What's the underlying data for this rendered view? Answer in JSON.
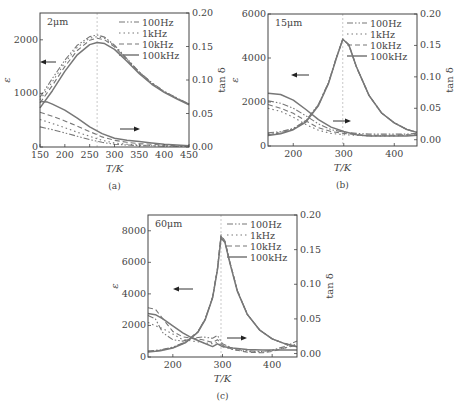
{
  "chart_data": [
    {
      "id": "a",
      "type": "line",
      "caption": "(a)",
      "annotation": "2μm",
      "xlabel": "T/K",
      "ylabel_left": "ε",
      "ylabel_right": "tan δ",
      "xlim": [
        150,
        450
      ],
      "ylim_left": [
        0,
        2500
      ],
      "ylim_right": [
        0,
        0.2
      ],
      "xticks": [
        150,
        200,
        250,
        300,
        350,
        400,
        450
      ],
      "yticks_left": [
        0,
        1000,
        2000
      ],
      "yticks_right": [
        0.0,
        0.05,
        0.1,
        0.15,
        0.2
      ],
      "peak_marker_x": 265,
      "legend": [
        "100Hz",
        "1kHz",
        "10kHz",
        "100kHz"
      ],
      "grid": false,
      "box": {
        "x": 40,
        "y": 13,
        "w": 149,
        "h": 134
      },
      "arrows": [
        {
          "dir": "left",
          "x": 56,
          "y": 62,
          "len": 16
        },
        {
          "dir": "right",
          "x": 120,
          "y": 129,
          "len": 20
        }
      ],
      "series_eps": [
        {
          "name": "100Hz",
          "x": [
            150,
            175,
            200,
            225,
            250,
            265,
            280,
            300,
            325,
            350,
            375,
            400,
            425,
            450
          ],
          "y": [
            930,
            1280,
            1620,
            1900,
            2060,
            2090,
            2050,
            1900,
            1650,
            1400,
            1200,
            1040,
            920,
            800
          ]
        },
        {
          "name": "1kHz",
          "x": [
            150,
            175,
            200,
            225,
            250,
            265,
            280,
            300,
            325,
            350,
            375,
            400,
            425,
            450
          ],
          "y": [
            880,
            1220,
            1570,
            1860,
            2030,
            2060,
            2030,
            1890,
            1640,
            1400,
            1190,
            1030,
            910,
            800
          ]
        },
        {
          "name": "10kHz",
          "x": [
            150,
            175,
            200,
            225,
            250,
            265,
            280,
            300,
            325,
            350,
            375,
            400,
            425,
            450
          ],
          "y": [
            820,
            1150,
            1500,
            1800,
            1990,
            2030,
            2000,
            1870,
            1630,
            1390,
            1190,
            1030,
            910,
            800
          ]
        },
        {
          "name": "100kHz",
          "x": [
            150,
            175,
            200,
            225,
            250,
            265,
            280,
            300,
            325,
            350,
            375,
            400,
            425,
            450
          ],
          "y": [
            730,
            1050,
            1410,
            1720,
            1910,
            1950,
            1930,
            1820,
            1600,
            1370,
            1170,
            1020,
            900,
            790
          ]
        }
      ],
      "series_tan": [
        {
          "name": "100Hz",
          "x": [
            150,
            175,
            200,
            225,
            250,
            275,
            300,
            325,
            350,
            375,
            400,
            425,
            450
          ],
          "y": [
            0.03,
            0.026,
            0.021,
            0.016,
            0.011,
            0.007,
            0.004,
            0.003,
            0.002,
            0.002,
            0.001,
            0.001,
            0.001
          ]
        },
        {
          "name": "1kHz",
          "x": [
            150,
            175,
            200,
            225,
            250,
            275,
            300,
            325,
            350,
            375,
            400,
            425,
            450
          ],
          "y": [
            0.041,
            0.035,
            0.029,
            0.022,
            0.016,
            0.01,
            0.006,
            0.004,
            0.003,
            0.002,
            0.002,
            0.001,
            0.001
          ]
        },
        {
          "name": "10kHz",
          "x": [
            150,
            175,
            200,
            225,
            250,
            275,
            300,
            325,
            350,
            375,
            400,
            425,
            450
          ],
          "y": [
            0.052,
            0.046,
            0.039,
            0.031,
            0.023,
            0.015,
            0.01,
            0.007,
            0.005,
            0.004,
            0.003,
            0.002,
            0.002
          ]
        },
        {
          "name": "100kHz",
          "x": [
            150,
            165,
            175,
            200,
            225,
            250,
            275,
            300,
            325,
            350,
            375,
            400,
            425,
            450
          ],
          "y": [
            0.068,
            0.067,
            0.064,
            0.055,
            0.043,
            0.03,
            0.02,
            0.013,
            0.01,
            0.008,
            0.006,
            0.004,
            0.003,
            0.002
          ]
        }
      ]
    },
    {
      "id": "b",
      "type": "line",
      "caption": "(b)",
      "annotation": "15μm",
      "xlabel": "T/K",
      "ylabel_left": "ε",
      "ylabel_right": "tan δ",
      "xlim": [
        150,
        445
      ],
      "ylim_left": [
        0,
        6000
      ],
      "ylim_right": [
        -0.01,
        0.2
      ],
      "xticks": [
        200,
        300,
        400
      ],
      "yticks_left": [
        0,
        2000,
        4000,
        6000
      ],
      "yticks_right": [
        0.0,
        0.05,
        0.1,
        0.15,
        0.2
      ],
      "peak_marker_x": 298,
      "legend": [
        "100Hz",
        "1kHz",
        "10kHz",
        "100kHz"
      ],
      "grid": false,
      "box": {
        "x": 268,
        "y": 14,
        "w": 149,
        "h": 132
      },
      "arrows": [
        {
          "dir": "left",
          "x": 309,
          "y": 75,
          "len": 18
        },
        {
          "dir": "right",
          "x": 333,
          "y": 121,
          "len": 18
        }
      ],
      "series_eps": [
        {
          "name": "100Hz",
          "x": [
            150,
            175,
            200,
            225,
            250,
            270,
            285,
            298,
            310,
            325,
            350,
            375,
            400,
            425,
            445
          ],
          "y": [
            600,
            650,
            800,
            1150,
            1900,
            2900,
            4000,
            4850,
            4600,
            3600,
            2300,
            1500,
            1050,
            750,
            620
          ]
        },
        {
          "name": "1kHz",
          "x": [
            150,
            175,
            200,
            225,
            250,
            270,
            285,
            298,
            310,
            325,
            350,
            375,
            400,
            425,
            445
          ],
          "y": [
            560,
            620,
            780,
            1130,
            1880,
            2880,
            3990,
            4850,
            4600,
            3600,
            2300,
            1500,
            1050,
            750,
            620
          ]
        },
        {
          "name": "10kHz",
          "x": [
            150,
            175,
            200,
            225,
            250,
            270,
            285,
            298,
            310,
            325,
            350,
            375,
            400,
            425,
            445
          ],
          "y": [
            520,
            590,
            760,
            1110,
            1860,
            2870,
            3980,
            4870,
            4610,
            3600,
            2300,
            1500,
            1050,
            750,
            620
          ]
        },
        {
          "name": "100kHz",
          "x": [
            150,
            175,
            200,
            225,
            250,
            270,
            285,
            298,
            310,
            325,
            350,
            375,
            400,
            425,
            445
          ],
          "y": [
            480,
            560,
            740,
            1090,
            1840,
            2860,
            3970,
            4850,
            4600,
            3600,
            2300,
            1500,
            1050,
            750,
            620
          ]
        }
      ],
      "series_tan": [
        {
          "name": "100Hz",
          "x": [
            150,
            175,
            200,
            225,
            250,
            275,
            300,
            325,
            350,
            375,
            400,
            425,
            445
          ],
          "y": [
            0.062,
            0.058,
            0.05,
            0.038,
            0.025,
            0.016,
            0.012,
            0.01,
            0.009,
            0.009,
            0.009,
            0.009,
            0.01
          ]
        },
        {
          "name": "1kHz",
          "x": [
            150,
            175,
            200,
            225,
            250,
            275,
            300,
            325,
            350,
            375,
            400,
            425,
            445
          ],
          "y": [
            0.05,
            0.045,
            0.036,
            0.024,
            0.015,
            0.01,
            0.008,
            0.007,
            0.006,
            0.006,
            0.006,
            0.007,
            0.007
          ]
        },
        {
          "name": "10kHz",
          "x": [
            150,
            175,
            200,
            225,
            250,
            275,
            300,
            325,
            350,
            375,
            400,
            425,
            445
          ],
          "y": [
            0.056,
            0.05,
            0.042,
            0.03,
            0.019,
            0.013,
            0.01,
            0.008,
            0.007,
            0.007,
            0.007,
            0.008,
            0.008
          ]
        },
        {
          "name": "100kHz",
          "x": [
            150,
            175,
            200,
            225,
            250,
            275,
            300,
            325,
            350,
            375,
            400,
            425,
            445
          ],
          "y": [
            0.074,
            0.072,
            0.063,
            0.048,
            0.032,
            0.02,
            0.013,
            0.008,
            0.006,
            0.006,
            0.006,
            0.006,
            0.007
          ]
        }
      ]
    },
    {
      "id": "c",
      "type": "line",
      "caption": "(c)",
      "annotation": "60μm",
      "xlabel": "T/K",
      "ylabel_left": "ε",
      "ylabel_right": "tan δ",
      "xlim": [
        150,
        450
      ],
      "ylim_left": [
        0,
        9000
      ],
      "ylim_right": [
        -0.005,
        0.2
      ],
      "xticks": [
        200,
        300,
        400
      ],
      "yticks_left": [
        0,
        2000,
        4000,
        6000,
        8000
      ],
      "yticks_right": [
        0.0,
        0.05,
        0.1,
        0.15,
        0.2
      ],
      "peak_marker_x": 297,
      "legend": [
        "100Hz",
        "1kHz",
        "10kHz",
        "100kHz"
      ],
      "grid": false,
      "box": {
        "x": 148,
        "y": 215,
        "w": 149,
        "h": 142
      },
      "arrows": [
        {
          "dir": "left",
          "x": 193,
          "y": 289,
          "len": 20
        },
        {
          "dir": "right",
          "x": 227,
          "y": 338,
          "len": 20
        }
      ],
      "series_eps": [
        {
          "name": "100Hz",
          "x": [
            150,
            175,
            200,
            225,
            250,
            265,
            280,
            290,
            297,
            305,
            315,
            330,
            350,
            375,
            400,
            425,
            450
          ],
          "y": [
            380,
            450,
            620,
            950,
            1600,
            2400,
            3800,
            5600,
            7650,
            7300,
            6000,
            4200,
            2700,
            1700,
            1150,
            850,
            650
          ]
        },
        {
          "name": "1kHz",
          "x": [
            150,
            175,
            200,
            225,
            250,
            265,
            280,
            290,
            297,
            305,
            315,
            330,
            350,
            375,
            400,
            425,
            450
          ],
          "y": [
            360,
            430,
            600,
            930,
            1580,
            2380,
            3780,
            5600,
            7700,
            7300,
            6000,
            4200,
            2700,
            1700,
            1150,
            850,
            650
          ]
        },
        {
          "name": "10kHz",
          "x": [
            150,
            175,
            200,
            225,
            250,
            265,
            280,
            290,
            297,
            305,
            315,
            330,
            350,
            375,
            400,
            425,
            450
          ],
          "y": [
            340,
            420,
            590,
            920,
            1570,
            2370,
            3770,
            5600,
            7750,
            7350,
            6000,
            4200,
            2700,
            1700,
            1150,
            850,
            650
          ]
        },
        {
          "name": "100kHz",
          "x": [
            150,
            175,
            200,
            225,
            250,
            265,
            280,
            290,
            297,
            305,
            315,
            330,
            350,
            375,
            400,
            425,
            450
          ],
          "y": [
            320,
            400,
            570,
            900,
            1550,
            2350,
            3750,
            5550,
            7550,
            7250,
            5950,
            4150,
            2700,
            1700,
            1150,
            850,
            650
          ]
        }
      ],
      "series_tan": [
        {
          "name": "100Hz",
          "x": [
            150,
            165,
            180,
            200,
            220,
            240,
            260,
            280,
            290,
            300,
            320,
            350,
            380,
            400,
            425,
            450
          ],
          "y": [
            0.055,
            0.05,
            0.03,
            0.02,
            0.018,
            0.022,
            0.024,
            0.022,
            0.026,
            0.014,
            0.008,
            0.004,
            0.003,
            0.005,
            0.01,
            0.018
          ]
        },
        {
          "name": "1kHz",
          "x": [
            150,
            165,
            180,
            200,
            220,
            240,
            260,
            280,
            290,
            300,
            320,
            350,
            380,
            400,
            425,
            450
          ],
          "y": [
            0.045,
            0.04,
            0.036,
            0.028,
            0.02,
            0.018,
            0.016,
            0.014,
            0.016,
            0.01,
            0.006,
            0.003,
            0.002,
            0.004,
            0.008,
            0.014
          ]
        },
        {
          "name": "10kHz",
          "x": [
            150,
            165,
            180,
            200,
            220,
            240,
            260,
            280,
            290,
            300,
            320,
            350,
            380,
            400,
            425,
            450
          ],
          "y": [
            0.066,
            0.064,
            0.05,
            0.032,
            0.024,
            0.022,
            0.02,
            0.016,
            0.02,
            0.012,
            0.006,
            0.002,
            0.001,
            0.003,
            0.008,
            0.012
          ]
        },
        {
          "name": "100kHz",
          "x": [
            150,
            165,
            180,
            200,
            220,
            240,
            260,
            280,
            290,
            300,
            320,
            350,
            380,
            400,
            425,
            450
          ],
          "y": [
            0.058,
            0.056,
            0.05,
            0.04,
            0.03,
            0.022,
            0.016,
            0.01,
            0.014,
            0.01,
            0.008,
            0.006,
            0.005,
            0.005,
            0.005,
            0.005
          ]
        }
      ]
    }
  ],
  "styles": {
    "line_color": "#777777",
    "axis_color": "#444444",
    "marker_line_color": "#bbbbbb",
    "dash": {
      "100Hz": "6,2,1.5,2,1.5,2",
      "1kHz": "1.5,3",
      "10kHz": "5,3",
      "100kHz": ""
    }
  }
}
